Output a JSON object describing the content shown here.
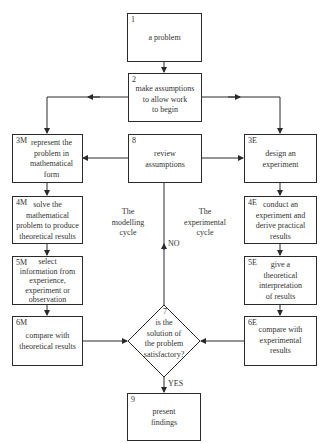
{
  "diagram": {
    "boxes": {
      "b1": {
        "num": "1",
        "text": "a problem"
      },
      "b2": {
        "num": "2",
        "text": "make assumptions\nto allow work\nto begin"
      },
      "b3m": {
        "num": "3M",
        "text": "represent the\nproblem in\nmathematical\nform"
      },
      "b4m": {
        "num": "4M",
        "text": "solve the\nmathematical\nproblem to produce\ntheoretical results"
      },
      "b5m": {
        "num": "5M",
        "text": "select\ninformation from\nexperience,\nexperiment or\nobservation"
      },
      "b6m": {
        "num": "6M",
        "text": "compare with\ntheoretical results"
      },
      "b8": {
        "num": "8",
        "text": "review\nassumptions"
      },
      "b3e": {
        "num": "3E",
        "text": "design an\nexperiment"
      },
      "b4e": {
        "num": "4E",
        "text": "conduct an\nexperiment and\nderive practical\nresults"
      },
      "b5e": {
        "num": "5E",
        "text": "give a\ntheoretical\ninterpretation\nof results"
      },
      "b6e": {
        "num": "6E",
        "text": "compare with\nexperimental\nresults"
      },
      "b7": {
        "num": "7",
        "text": "is the\nsolution of\nthe problem\nsatisfactory?"
      },
      "b9": {
        "num": "9",
        "text": "present\nfindings"
      }
    },
    "labels": {
      "modelling": "The\nmodelling\ncycle",
      "experimental": "The\nexperimental\ncycle",
      "no": "NO",
      "yes": "YES"
    },
    "colors": {
      "line": "#2a2a2a",
      "text": "#333333",
      "background": "#ffffff"
    }
  }
}
